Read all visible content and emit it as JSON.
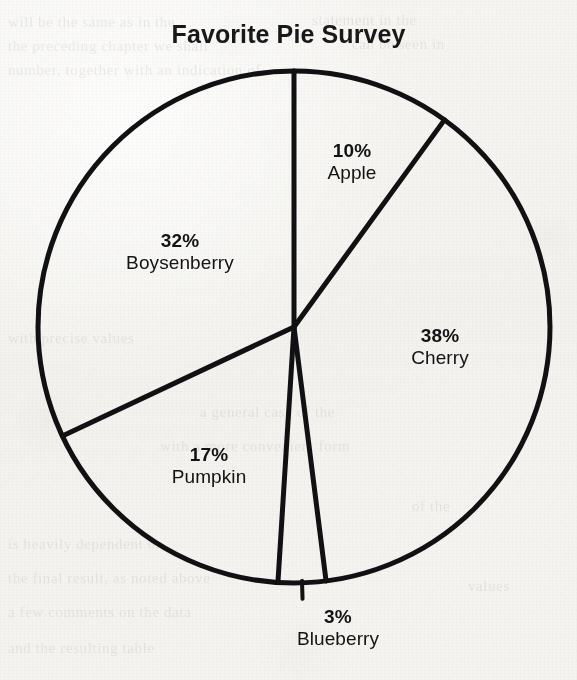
{
  "chart_data": {
    "type": "pie",
    "title": "Favorite Pie Survey",
    "xlabel": "",
    "ylabel": "",
    "units": "percent",
    "total": 100,
    "legend_position": "none",
    "grid": false,
    "start_angle_deg": 0,
    "direction": "clockwise",
    "categories": [
      "Apple",
      "Cherry",
      "Blueberry",
      "Pumpkin",
      "Boysenberry"
    ],
    "values": [
      10,
      38,
      3,
      17,
      32
    ],
    "slices": [
      {
        "name": "Apple",
        "value": 10,
        "pct_label": "10%",
        "label_x": 352,
        "label_y": 162,
        "label_placement": "inside",
        "leader": false
      },
      {
        "name": "Cherry",
        "value": 38,
        "pct_label": "38%",
        "label_x": 440,
        "label_y": 347,
        "label_placement": "inside",
        "leader": false
      },
      {
        "name": "Blueberry",
        "value": 3,
        "pct_label": "3%",
        "label_x": 338,
        "label_y": 628,
        "label_placement": "outside",
        "leader": true
      },
      {
        "name": "Pumpkin",
        "value": 17,
        "pct_label": "17%",
        "label_x": 209,
        "label_y": 466,
        "label_placement": "inside",
        "leader": false
      },
      {
        "name": "Boysenberry",
        "value": 32,
        "pct_label": "32%",
        "label_x": 180,
        "label_y": 252,
        "label_placement": "inside",
        "leader": false
      }
    ],
    "geometry": {
      "center_x": 294,
      "center_y": 327,
      "radius": 256,
      "stroke_width": 5,
      "stroke_color": "#111113",
      "fill_color": "none"
    }
  },
  "colors": {
    "ink": "#111113",
    "paper": "#f6f5f2",
    "ghost_text": "#9a968d"
  },
  "background_text": {
    "lines": [
      {
        "text": "will be the same as in the",
        "x": 8,
        "y": 14
      },
      {
        "text": "the preceding chapter we shall",
        "x": 8,
        "y": 38
      },
      {
        "text": "number, together with an indication of",
        "x": 8,
        "y": 62
      },
      {
        "text": "statement in the",
        "x": 312,
        "y": 12
      },
      {
        "text": "can be seen in",
        "x": 352,
        "y": 36
      },
      {
        "text": "with precise values",
        "x": 8,
        "y": 330
      },
      {
        "text": "a general case of the",
        "x": 200,
        "y": 404
      },
      {
        "text": "with a more convenient form",
        "x": 160,
        "y": 438
      },
      {
        "text": "is heavily dependent on",
        "x": 8,
        "y": 536
      },
      {
        "text": "the final result, as noted above",
        "x": 8,
        "y": 570
      },
      {
        "text": "a few comments on the data",
        "x": 8,
        "y": 604
      },
      {
        "text": "and the resulting table",
        "x": 8,
        "y": 640
      },
      {
        "text": "of the",
        "x": 412,
        "y": 498
      },
      {
        "text": "values",
        "x": 468,
        "y": 578
      }
    ]
  }
}
